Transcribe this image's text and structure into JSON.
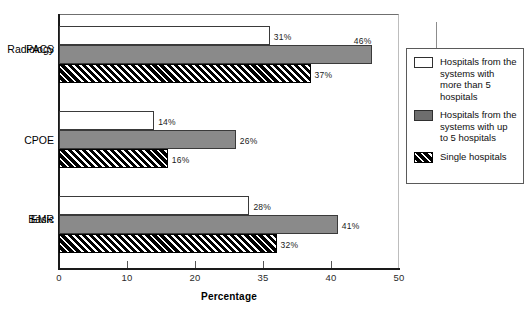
{
  "chart_data": {
    "type": "bar",
    "orientation": "horizontal",
    "title": "",
    "xlabel": "Percentage",
    "ylabel": "",
    "xlim": [
      0,
      50
    ],
    "xticks": [
      "0",
      "10",
      "20",
      "35",
      "40",
      "50"
    ],
    "grid": false,
    "legend_position": "right",
    "categories": [
      "Radiology PACS",
      "CPOE",
      "Basic EMR"
    ],
    "series": [
      {
        "name": "Hospitals from the systems with more than 5 hospitals",
        "style": "white",
        "values": [
          31,
          46,
          37
        ]
      },
      {
        "name": "Hospitals from the systems with up to 5 hospitals",
        "style": "gray",
        "values": [
          14,
          26,
          16
        ]
      },
      {
        "name": "Single hospitals",
        "style": "hatch",
        "values": [
          28,
          41,
          32
        ]
      }
    ],
    "groups": [
      {
        "category_line1": "Radiology",
        "category_line2": "PACS",
        "bars": [
          {
            "label": "31%",
            "value": 31,
            "style": "white"
          },
          {
            "label": "46%",
            "value": 46,
            "style": "gray"
          },
          {
            "label": "37%",
            "value": 37,
            "style": "hatch"
          }
        ]
      },
      {
        "category_line1": "CPOE",
        "category_line2": "",
        "bars": [
          {
            "label": "14%",
            "value": 14,
            "style": "white"
          },
          {
            "label": "26%",
            "value": 26,
            "style": "gray"
          },
          {
            "label": "16%",
            "value": 16,
            "style": "hatch"
          }
        ]
      },
      {
        "category_line1": "Basic",
        "category_line2": "EMR",
        "bars": [
          {
            "label": "28%",
            "value": 28,
            "style": "white"
          },
          {
            "label": "41%",
            "value": 41,
            "style": "gray"
          },
          {
            "label": "32%",
            "value": 32,
            "style": "hatch"
          }
        ]
      }
    ]
  },
  "axis": {
    "x_title": "Percentage",
    "ticks": [
      {
        "label": "0"
      },
      {
        "label": "10"
      },
      {
        "label": "20"
      },
      {
        "label": "35"
      },
      {
        "label": "40"
      },
      {
        "label": "50"
      }
    ]
  },
  "legend": {
    "items": [
      {
        "swatch": "white-swatch",
        "label": "Hospitals from the systems with more than 5 hospitals"
      },
      {
        "swatch": "gray-swatch",
        "label": "Hospitals from the systems with up to 5 hospitals"
      },
      {
        "swatch": "hatch-swatch",
        "label": "Single hospitals"
      }
    ]
  },
  "colors": {
    "gray_bar": "#8a8a8a",
    "hatch_bar": "#000000",
    "white_bar": "#ffffff",
    "axis": "#1a1a1a"
  }
}
